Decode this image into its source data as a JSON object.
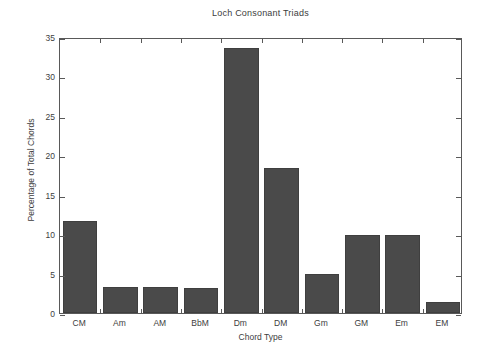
{
  "chart_data": {
    "type": "bar",
    "title": "Loch Consonant Triads",
    "xlabel": "Chord Type",
    "ylabel": "Percentage of Total Chords",
    "categories": [
      "CM",
      "Am",
      "AM",
      "BbM",
      "Dm",
      "DM",
      "Gm",
      "GM",
      "Em",
      "EM"
    ],
    "values": [
      11.7,
      3.3,
      3.3,
      3.2,
      33.6,
      18.4,
      4.9,
      9.9,
      9.9,
      1.4
    ],
    "ylim": [
      0,
      35
    ],
    "yticks": [
      0,
      5,
      10,
      15,
      20,
      25,
      30,
      35
    ],
    "ytick_labels": [
      "0",
      "5",
      "10",
      "15",
      "20",
      "25",
      "30",
      "35"
    ],
    "grid": false,
    "legend": null,
    "bar_color": "#4a4a4a",
    "axis_color": "#595959",
    "background_color": "#ffffff"
  }
}
